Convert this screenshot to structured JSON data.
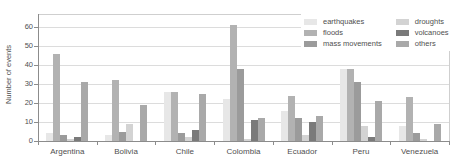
{
  "chart_data": {
    "type": "bar",
    "title": "",
    "xlabel": "",
    "ylabel": "Number of events",
    "ylim": [
      0,
      67
    ],
    "yticks": [
      0,
      10,
      20,
      30,
      40,
      50,
      60
    ],
    "grid": true,
    "legend_position": "top-right",
    "categories": [
      "Argentina",
      "Bolivia",
      "Chile",
      "Colombia",
      "Ecuador",
      "Peru",
      "Venezuela"
    ],
    "series": [
      {
        "name": "earthquakes",
        "color": "#e7e7e7",
        "values": [
          4,
          3,
          26,
          22,
          16,
          38,
          8
        ]
      },
      {
        "name": "floods",
        "color": "#b2b2b2",
        "values": [
          46,
          32,
          26,
          61,
          24,
          38,
          23
        ]
      },
      {
        "name": "mass movements",
        "color": "#9b9b9b",
        "values": [
          3,
          5,
          4,
          38,
          12,
          31,
          4
        ]
      },
      {
        "name": "droughts",
        "color": "#d3d3d3",
        "values": [
          1,
          9,
          2,
          1,
          3,
          8,
          1
        ]
      },
      {
        "name": "volcanoes",
        "color": "#7a7a7a",
        "values": [
          2,
          0,
          6,
          11,
          10,
          2,
          0
        ]
      },
      {
        "name": "others",
        "color": "#a9a9a9",
        "values": [
          31,
          19,
          25,
          12,
          13,
          21,
          9
        ]
      }
    ]
  }
}
